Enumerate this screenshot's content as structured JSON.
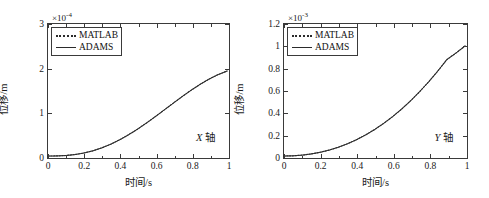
{
  "figure": {
    "panels": [
      {
        "id": "x-axis-panel",
        "annotation_var": "X",
        "annotation_unit": "轴",
        "exponent_prefix": "×10",
        "exponent_power": "-4",
        "xlabel": "时间/s",
        "ylabel": "位移/m",
        "legend": [
          {
            "label": "MATLAB",
            "style": "dotted",
            "color": "#2b2b2b"
          },
          {
            "label": "ADAMS",
            "style": "solid",
            "color": "#2b2b2b"
          }
        ],
        "chart_data": {
          "type": "line",
          "title": "",
          "subtitle": "",
          "xlabel": "时间/s",
          "ylabel": "位移/m",
          "annotation": "X 轴",
          "y_multiplier": 0.0001,
          "y_multiplier_label": "×10⁻⁴",
          "xlim": [
            0,
            1
          ],
          "ylim": [
            0,
            3
          ],
          "xticks": [
            0,
            0.2,
            0.4,
            0.6,
            0.8,
            1
          ],
          "xticklabels": [
            "0",
            "0.2",
            "0.4",
            "0.6",
            "0.8",
            "1"
          ],
          "yticks": [
            0,
            1,
            2,
            3
          ],
          "yticklabels": [
            "0",
            "1",
            "2",
            "3"
          ],
          "grid": false,
          "legend_position": "upper-left",
          "x": [
            0,
            0.05,
            0.1,
            0.15,
            0.2,
            0.25,
            0.3,
            0.35,
            0.4,
            0.45,
            0.5,
            0.55,
            0.6,
            0.65,
            0.7,
            0.75,
            0.8,
            0.85,
            0.9,
            0.95,
            1.0
          ],
          "series": [
            {
              "name": "MATLAB",
              "style": "dotted",
              "values": [
                0.0,
                0.002,
                0.012,
                0.033,
                0.068,
                0.118,
                0.185,
                0.268,
                0.368,
                0.483,
                0.611,
                0.75,
                0.897,
                1.049,
                1.202,
                1.353,
                1.497,
                1.63,
                1.749,
                1.85,
                1.93
              ]
            },
            {
              "name": "ADAMS",
              "style": "solid",
              "values": [
                0.0,
                0.002,
                0.012,
                0.033,
                0.068,
                0.118,
                0.185,
                0.268,
                0.368,
                0.483,
                0.611,
                0.75,
                0.897,
                1.049,
                1.202,
                1.353,
                1.497,
                1.63,
                1.749,
                1.85,
                1.93
              ]
            }
          ],
          "values_note": "values are in units of the y_multiplier (×10^-4); curve is S-shaped rising from 0 to about 2.72"
        }
      },
      {
        "id": "y-axis-panel",
        "annotation_var": "Y",
        "annotation_unit": "轴",
        "exponent_prefix": "×10",
        "exponent_power": "-3",
        "xlabel": "时间/s",
        "ylabel": "位移/m",
        "legend": [
          {
            "label": "MATLAB",
            "style": "dotted",
            "color": "#2b2b2b"
          },
          {
            "label": "ADAMS",
            "style": "solid",
            "color": "#2b2b2b"
          }
        ],
        "chart_data": {
          "type": "line",
          "title": "",
          "subtitle": "",
          "xlabel": "时间/s",
          "ylabel": "位移/m",
          "annotation": "Y 轴",
          "y_multiplier": 0.001,
          "y_multiplier_label": "×10⁻³",
          "xlim": [
            0,
            1
          ],
          "ylim": [
            0,
            1.2
          ],
          "xticks": [
            0,
            0.2,
            0.4,
            0.6,
            0.8,
            1
          ],
          "xticklabels": [
            "0",
            "0.2",
            "0.4",
            "0.6",
            "0.8",
            "1"
          ],
          "yticks": [
            0,
            0.2,
            0.4,
            0.6,
            0.8,
            1,
            1.2
          ],
          "yticklabels": [
            "0",
            "0.2",
            "0.4",
            "0.6",
            "0.8",
            "1",
            "1.2"
          ],
          "grid": false,
          "legend_position": "upper-left",
          "x": [
            0,
            0.05,
            0.1,
            0.15,
            0.2,
            0.25,
            0.3,
            0.35,
            0.4,
            0.45,
            0.5,
            0.55,
            0.6,
            0.65,
            0.7,
            0.75,
            0.8,
            0.85,
            0.9,
            0.95,
            1.0
          ],
          "series": [
            {
              "name": "MATLAB",
              "style": "dotted",
              "values": [
                0.0,
                0.002,
                0.008,
                0.019,
                0.034,
                0.054,
                0.08,
                0.111,
                0.148,
                0.191,
                0.24,
                0.296,
                0.358,
                0.427,
                0.503,
                0.586,
                0.676,
                0.773,
                0.877,
                0.936,
                1.0
              ]
            },
            {
              "name": "ADAMS",
              "style": "solid",
              "values": [
                0.0,
                0.002,
                0.008,
                0.019,
                0.034,
                0.054,
                0.08,
                0.111,
                0.148,
                0.191,
                0.24,
                0.296,
                0.358,
                0.427,
                0.503,
                0.586,
                0.676,
                0.773,
                0.877,
                0.936,
                1.0
              ]
            }
          ],
          "values_note": "values are in units of the y_multiplier (×10^-3); curve is convex rising from 0 to about 1.0"
        }
      }
    ]
  },
  "chart_data": [
    {
      "type": "line",
      "title": "X 轴",
      "xlabel": "时间/s",
      "ylabel": "位移/m",
      "y_multiplier_label": "×10⁻⁴",
      "xlim": [
        0,
        1
      ],
      "ylim": [
        0,
        3
      ],
      "xticks": [
        0,
        0.2,
        0.4,
        0.6,
        0.8,
        1
      ],
      "yticks": [
        0,
        1,
        2,
        3
      ],
      "grid": false,
      "legend_position": "upper-left",
      "x": [
        0,
        0.05,
        0.1,
        0.15,
        0.2,
        0.25,
        0.3,
        0.35,
        0.4,
        0.45,
        0.5,
        0.55,
        0.6,
        0.65,
        0.7,
        0.75,
        0.8,
        0.85,
        0.9,
        0.95,
        1.0
      ],
      "series": [
        {
          "name": "MATLAB",
          "values": [
            0.0,
            0.002,
            0.012,
            0.033,
            0.068,
            0.118,
            0.185,
            0.268,
            0.368,
            0.483,
            0.611,
            0.75,
            0.897,
            1.049,
            1.202,
            1.353,
            1.497,
            1.63,
            1.749,
            1.85,
            1.93
          ]
        },
        {
          "name": "ADAMS",
          "values": [
            0.0,
            0.002,
            0.012,
            0.033,
            0.068,
            0.118,
            0.185,
            0.268,
            0.368,
            0.483,
            0.611,
            0.75,
            0.897,
            1.049,
            1.202,
            1.353,
            1.497,
            1.63,
            1.749,
            1.85,
            1.93
          ]
        }
      ]
    },
    {
      "type": "line",
      "title": "Y 轴",
      "xlabel": "时间/s",
      "ylabel": "位移/m",
      "y_multiplier_label": "×10⁻³",
      "xlim": [
        0,
        1
      ],
      "ylim": [
        0,
        1.2
      ],
      "xticks": [
        0,
        0.2,
        0.4,
        0.6,
        0.8,
        1
      ],
      "yticks": [
        0,
        0.2,
        0.4,
        0.6,
        0.8,
        1,
        1.2
      ],
      "grid": false,
      "legend_position": "upper-left",
      "x": [
        0,
        0.05,
        0.1,
        0.15,
        0.2,
        0.25,
        0.3,
        0.35,
        0.4,
        0.45,
        0.5,
        0.55,
        0.6,
        0.65,
        0.7,
        0.75,
        0.8,
        0.85,
        0.9,
        0.95,
        1.0
      ],
      "series": [
        {
          "name": "MATLAB",
          "values": [
            0.0,
            0.002,
            0.008,
            0.019,
            0.034,
            0.054,
            0.08,
            0.111,
            0.148,
            0.191,
            0.24,
            0.296,
            0.358,
            0.427,
            0.503,
            0.586,
            0.676,
            0.773,
            0.877,
            0.936,
            1.0
          ]
        },
        {
          "name": "ADAMS",
          "values": [
            0.0,
            0.002,
            0.008,
            0.019,
            0.034,
            0.054,
            0.08,
            0.111,
            0.148,
            0.191,
            0.24,
            0.296,
            0.358,
            0.427,
            0.503,
            0.586,
            0.676,
            0.773,
            0.877,
            0.936,
            1.0
          ]
        }
      ]
    }
  ]
}
